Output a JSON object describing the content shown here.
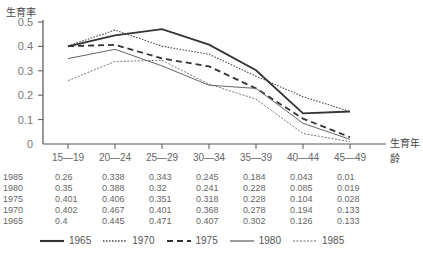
{
  "chart_data": {
    "type": "line",
    "title": "",
    "xlabel": "生育年龄",
    "ylabel": "生育率",
    "ylim": [
      0,
      0.5
    ],
    "yticks": [
      "0",
      "0.1",
      "0.2",
      "0.3",
      "0.4",
      "0.5"
    ],
    "grid": false,
    "legend_position": "bottom",
    "categories": [
      "15—19",
      "20—24",
      "25—29",
      "30—34",
      "35—39",
      "40—44",
      "45—49"
    ],
    "series": [
      {
        "name": "1965",
        "style": "solid-thick",
        "values": [
          0.4,
          0.445,
          0.471,
          0.407,
          0.302,
          0.126,
          0.133
        ]
      },
      {
        "name": "1970",
        "style": "dotted",
        "values": [
          0.402,
          0.467,
          0.401,
          0.368,
          0.278,
          0.194,
          0.133
        ]
      },
      {
        "name": "1975",
        "style": "dashed-thick",
        "values": [
          0.401,
          0.406,
          0.351,
          0.318,
          0.228,
          0.104,
          0.028
        ]
      },
      {
        "name": "1980",
        "style": "solid-thin",
        "values": [
          0.35,
          0.388,
          0.32,
          0.241,
          0.228,
          0.085,
          0.019
        ]
      },
      {
        "name": "1985",
        "style": "dashed-thin",
        "values": [
          0.26,
          0.338,
          0.343,
          0.245,
          0.184,
          0.043,
          0.01
        ]
      }
    ],
    "table_rows": [
      {
        "year": "1985",
        "values": [
          "0.26",
          "0.338",
          "0.343",
          "0.245",
          "0.184",
          "0.043",
          "0.01"
        ]
      },
      {
        "year": "1980",
        "values": [
          "0.35",
          "0.388",
          "0.32",
          "0.241",
          "0.228",
          "0.085",
          "0.019"
        ]
      },
      {
        "year": "1975",
        "values": [
          "0.401",
          "0.406",
          "0.351",
          "0.318",
          "0.228",
          "0.104",
          "0.028"
        ]
      },
      {
        "year": "1970",
        "values": [
          "0.402",
          "0.467",
          "0.401",
          "0.368",
          "0.278",
          "0.194",
          "0.133"
        ]
      },
      {
        "year": "1965",
        "values": [
          "0.4",
          "0.445",
          "0.471",
          "0.407",
          "0.302",
          "0.126",
          "0.133"
        ]
      }
    ]
  },
  "labels": {
    "ylabel": "生育率",
    "xlabel": "生育年龄"
  },
  "legend": [
    {
      "name": "1965",
      "style": "solid-thick"
    },
    {
      "name": "1970",
      "style": "dotted"
    },
    {
      "name": "1975",
      "style": "dashed-thick"
    },
    {
      "name": "1980",
      "style": "solid-thin"
    },
    {
      "name": "1985",
      "style": "dashed-thin"
    }
  ],
  "colors": {
    "axis": "#555555",
    "line_dark": "#333333",
    "line_mid": "#666666",
    "text": "#555555"
  }
}
